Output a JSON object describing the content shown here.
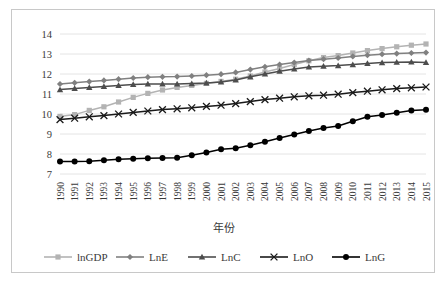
{
  "chart_data": {
    "type": "line",
    "title": "",
    "xlabel": "年份",
    "ylabel": "",
    "ylim": [
      7,
      14
    ],
    "yticks": [
      7,
      8,
      9,
      10,
      11,
      12,
      13,
      14
    ],
    "grid": true,
    "legend_position": "bottom",
    "x": [
      1990,
      1991,
      1992,
      1993,
      1994,
      1995,
      1996,
      1997,
      1998,
      1999,
      2000,
      2001,
      2002,
      2003,
      2004,
      2005,
      2006,
      2007,
      2008,
      2009,
      2010,
      2011,
      2012,
      2013,
      2014,
      2015
    ],
    "categories": [
      "1990",
      "1991",
      "1992",
      "1993",
      "1994",
      "1995",
      "1996",
      "1997",
      "1998",
      "1999",
      "2000",
      "2001",
      "2002",
      "2003",
      "2004",
      "2005",
      "2006",
      "2007",
      "2008",
      "2009",
      "2010",
      "2011",
      "2012",
      "2013",
      "2014",
      "2015"
    ],
    "series": [
      {
        "name": "lnGDP",
        "marker": "square",
        "color": "#b3b3b3",
        "values": [
          9.88,
          9.97,
          10.18,
          10.36,
          10.6,
          10.83,
          11.03,
          11.2,
          11.33,
          11.43,
          11.53,
          11.63,
          11.74,
          11.9,
          12.1,
          12.28,
          12.47,
          12.66,
          12.82,
          12.92,
          13.05,
          13.17,
          13.27,
          13.36,
          13.44,
          13.5
        ]
      },
      {
        "name": "LnE",
        "marker": "diamond",
        "color": "#808080",
        "values": [
          11.5,
          11.56,
          11.62,
          11.68,
          11.74,
          11.8,
          11.84,
          11.86,
          11.87,
          11.9,
          11.94,
          11.99,
          12.08,
          12.22,
          12.36,
          12.47,
          12.57,
          12.67,
          12.74,
          12.8,
          12.88,
          12.94,
          12.99,
          13.02,
          13.05,
          13.07
        ]
      },
      {
        "name": "LnC",
        "marker": "triangle",
        "color": "#4d4d4d",
        "values": [
          11.22,
          11.28,
          11.33,
          11.38,
          11.43,
          11.48,
          11.5,
          11.5,
          11.5,
          11.52,
          11.55,
          11.6,
          11.7,
          11.86,
          12.0,
          12.14,
          12.25,
          12.35,
          12.39,
          12.42,
          12.47,
          12.53,
          12.57,
          12.59,
          12.6,
          12.58
        ]
      },
      {
        "name": "LnO",
        "marker": "x",
        "color": "#1a1a1a",
        "values": [
          9.72,
          9.79,
          9.86,
          9.92,
          10.0,
          10.08,
          10.15,
          10.22,
          10.26,
          10.31,
          10.38,
          10.44,
          10.52,
          10.62,
          10.72,
          10.79,
          10.86,
          10.91,
          10.94,
          10.99,
          11.07,
          11.14,
          11.21,
          11.27,
          11.31,
          11.35
        ]
      },
      {
        "name": "LnG",
        "marker": "circle",
        "color": "#000000",
        "values": [
          7.63,
          7.63,
          7.64,
          7.69,
          7.74,
          7.76,
          7.79,
          7.8,
          7.81,
          7.94,
          8.08,
          8.24,
          8.29,
          8.44,
          8.61,
          8.8,
          8.98,
          9.15,
          9.3,
          9.4,
          9.64,
          9.86,
          9.95,
          10.06,
          10.17,
          10.21
        ]
      }
    ]
  },
  "legend": {
    "items": [
      {
        "label": "lnGDP",
        "marker": "square",
        "color": "#b3b3b3"
      },
      {
        "label": "LnE",
        "marker": "diamond",
        "color": "#808080"
      },
      {
        "label": "LnC",
        "marker": "triangle",
        "color": "#4d4d4d"
      },
      {
        "label": "LnO",
        "marker": "x",
        "color": "#1a1a1a"
      },
      {
        "label": "LnG",
        "marker": "circle",
        "color": "#000000"
      }
    ]
  },
  "colors": {
    "frame_border": "#c8c8c8",
    "gridline": "#e4e4e4",
    "text": "#3a3a3a",
    "background": "#ffffff"
  }
}
